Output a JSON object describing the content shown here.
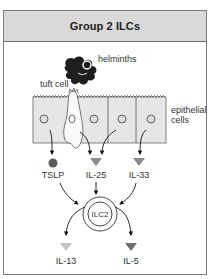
{
  "title": "Group 2 ILCs",
  "labels": {
    "helminths": "helminths",
    "tuft_cell": "tuft cell",
    "epithelial_line1": "epithelial",
    "epithelial_line2": "cells",
    "tslp": "TSLP",
    "il25": "IL-25",
    "il33": "IL-33",
    "ilc2": "ILC2",
    "il13": "IL-13",
    "il5": "IL-5"
  },
  "colors": {
    "header_bg": "#d9d9d9",
    "frame_border": "#7a7a7a",
    "cell_fill": "#e6e6e6",
    "tslp_dot": "#5a5a5a",
    "il25_triangle": "#8a8a8a",
    "il33_triangle": "#8a8a8a",
    "il13_triangle": "#c4c4c4",
    "il5_triangle": "#6e6e6e",
    "helminth": "#1e1e1e"
  }
}
